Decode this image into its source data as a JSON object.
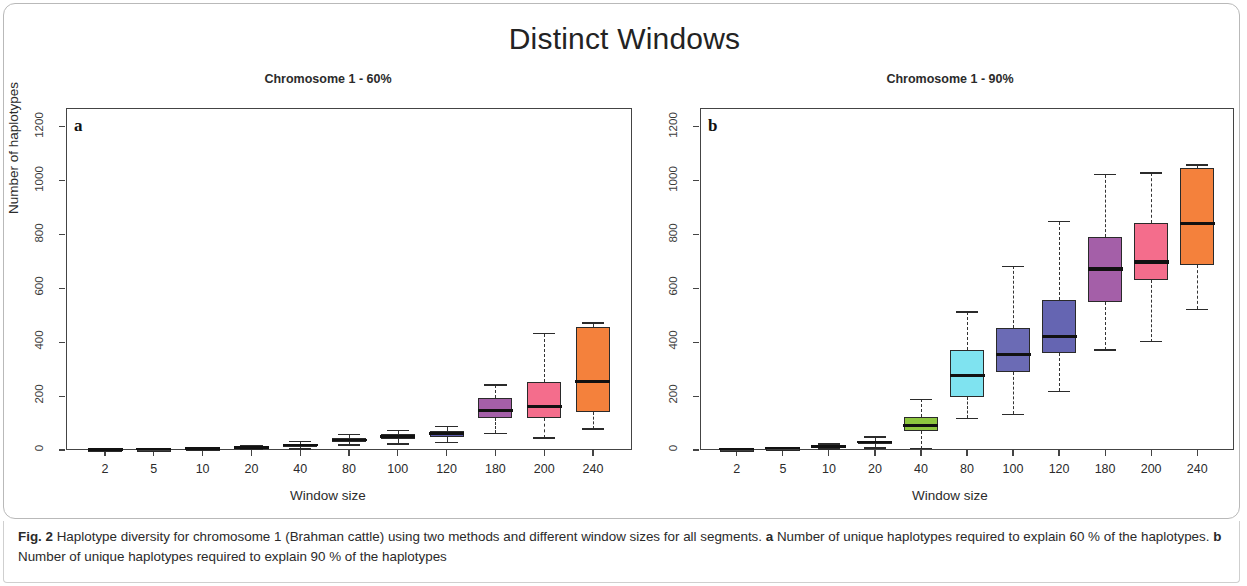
{
  "figure": {
    "title": "Distinct Windows",
    "caption_label": "Fig. 2",
    "caption_line1": "Haplotype diversity for chromosome 1 (Brahman cattle) using two methods and different window sizes for all segments.",
    "caption_a_label": "a",
    "caption_a_text": "Number of unique haplotypes required to explain 60 % of the haplotypes.",
    "caption_b_label": "b",
    "caption_b_text": "Number of unique haplotypes required to explain 90 % of the haplotypes"
  },
  "chart_data": [
    {
      "type": "box",
      "panel_letter": "a",
      "title": "Chromosome 1 - 60%",
      "xlabel": "Window size",
      "ylabel": "Number of haplotypes",
      "ylim": [
        0,
        1270
      ],
      "yticks": [
        0,
        200,
        400,
        600,
        800,
        1000,
        1200
      ],
      "ytick_labels": [
        "0",
        "200",
        "400",
        "600",
        "800",
        "1000",
        "1200"
      ],
      "grid": false,
      "categories": [
        "2",
        "5",
        "10",
        "20",
        "40",
        "80",
        "100",
        "120",
        "180",
        "200",
        "240"
      ],
      "boxes": [
        {
          "category": "2",
          "whisker_low": 1,
          "q1": 1,
          "median": 1,
          "q3": 2,
          "whisker_high": 2,
          "color": "#3f3f3f"
        },
        {
          "category": "5",
          "whisker_low": 1,
          "q1": 2,
          "median": 2,
          "q3": 3,
          "whisker_high": 4,
          "color": "#3f3f3f"
        },
        {
          "category": "10",
          "whisker_low": 2,
          "q1": 3,
          "median": 4,
          "q3": 5,
          "whisker_high": 7,
          "color": "#4a4a4a"
        },
        {
          "category": "20",
          "whisker_low": 3,
          "q1": 6,
          "median": 8,
          "q3": 12,
          "whisker_high": 17,
          "color": "#55555e"
        },
        {
          "category": "40",
          "whisker_low": 4,
          "q1": 11,
          "median": 16,
          "q3": 22,
          "whisker_high": 32,
          "color": "#4f5560"
        },
        {
          "category": "80",
          "whisker_low": 18,
          "q1": 28,
          "median": 35,
          "q3": 45,
          "whisker_high": 58,
          "color": "#5d9a9a"
        },
        {
          "category": "100",
          "whisker_low": 22,
          "q1": 40,
          "median": 48,
          "q3": 58,
          "whisker_high": 72,
          "color": "#4e4e96"
        },
        {
          "category": "120",
          "whisker_low": 28,
          "q1": 50,
          "median": 60,
          "q3": 72,
          "whisker_high": 88,
          "color": "#5b5bac"
        },
        {
          "category": "180",
          "whisker_low": 62,
          "q1": 118,
          "median": 148,
          "q3": 192,
          "whisker_high": 242,
          "color": "#a45fa8"
        },
        {
          "category": "200",
          "whisker_low": 45,
          "q1": 120,
          "median": 162,
          "q3": 252,
          "whisker_high": 432,
          "color": "#f46d8c"
        },
        {
          "category": "240",
          "whisker_low": 78,
          "q1": 140,
          "median": 255,
          "q3": 455,
          "whisker_high": 472,
          "color": "#f4813c"
        }
      ]
    },
    {
      "type": "box",
      "panel_letter": "b",
      "title": "Chromosome 1 - 90%",
      "xlabel": "Window size",
      "ylabel": "",
      "ylim": [
        0,
        1270
      ],
      "yticks": [
        0,
        200,
        400,
        600,
        800,
        1000,
        1200
      ],
      "ytick_labels": [
        "0",
        "200",
        "400",
        "600",
        "800",
        "1000",
        "1200"
      ],
      "grid": false,
      "categories": [
        "2",
        "5",
        "10",
        "20",
        "40",
        "80",
        "100",
        "120",
        "180",
        "200",
        "240"
      ],
      "boxes": [
        {
          "category": "2",
          "whisker_low": 1,
          "q1": 2,
          "median": 2,
          "q3": 3,
          "whisker_high": 4,
          "color": "#3f3f3f"
        },
        {
          "category": "5",
          "whisker_low": 2,
          "q1": 4,
          "median": 5,
          "q3": 6,
          "whisker_high": 8,
          "color": "#3f3f3f"
        },
        {
          "category": "10",
          "whisker_low": 4,
          "q1": 8,
          "median": 11,
          "q3": 15,
          "whisker_high": 22,
          "color": "#4a4a4a"
        },
        {
          "category": "20",
          "whisker_low": 8,
          "q1": 22,
          "median": 28,
          "q3": 35,
          "whisker_high": 48,
          "color": "#4c6a2c"
        },
        {
          "category": "40",
          "whisker_low": 5,
          "q1": 70,
          "median": 92,
          "q3": 122,
          "whisker_high": 188,
          "color": "#8dc63f"
        },
        {
          "category": "80",
          "whisker_low": 118,
          "q1": 198,
          "median": 278,
          "q3": 372,
          "whisker_high": 512,
          "color": "#7fe3f0"
        },
        {
          "category": "100",
          "whisker_low": 132,
          "q1": 290,
          "median": 355,
          "q3": 452,
          "whisker_high": 682,
          "color": "#6b6bb5"
        },
        {
          "category": "120",
          "whisker_low": 218,
          "q1": 362,
          "median": 422,
          "q3": 558,
          "whisker_high": 848,
          "color": "#6565b2"
        },
        {
          "category": "180",
          "whisker_low": 372,
          "q1": 548,
          "median": 672,
          "q3": 792,
          "whisker_high": 1022,
          "color": "#a45fa8"
        },
        {
          "category": "200",
          "whisker_low": 402,
          "q1": 632,
          "median": 698,
          "q3": 842,
          "whisker_high": 1028,
          "color": "#f46d8c"
        },
        {
          "category": "240",
          "whisker_low": 522,
          "q1": 688,
          "median": 842,
          "q3": 1048,
          "whisker_high": 1058,
          "color": "#f4813c"
        }
      ]
    }
  ]
}
